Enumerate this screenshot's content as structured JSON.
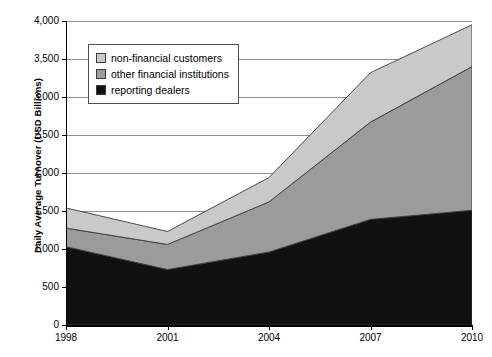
{
  "chart_data": {
    "type": "area",
    "stacked": true,
    "title": "",
    "xlabel": "",
    "ylabel": "Daily Average Turnover (USD Billions)",
    "categories": [
      "1998",
      "2001",
      "2004",
      "2007",
      "2010"
    ],
    "x": [
      1998,
      2001,
      2004,
      2007,
      2010
    ],
    "xlim": [
      1998,
      2010
    ],
    "ylim": [
      0,
      4000
    ],
    "y_ticks": [
      "0",
      "500",
      "1,000",
      "1,500",
      "2,000",
      "2,500",
      "3,000",
      "3,500",
      "4,000"
    ],
    "y_tick_values": [
      0,
      500,
      1000,
      1500,
      2000,
      2500,
      3000,
      3500,
      4000
    ],
    "y_tick_step": 500,
    "grid": true,
    "grid_axis": "y",
    "legend_position": "upper-left-inside",
    "series": [
      {
        "name": "reporting dealers",
        "color": "#111111",
        "values": [
          1030,
          730,
          960,
          1390,
          1510
        ]
      },
      {
        "name": "other financial institutions",
        "color": "#9b9b9b",
        "values": [
          245,
          330,
          660,
          1280,
          1890
        ]
      },
      {
        "name": "non-financial customers",
        "color": "#c9c9c9",
        "values": [
          265,
          170,
          320,
          650,
          550
        ]
      }
    ],
    "cumulative_totals": {
      "reporting_dealers": [
        1030,
        730,
        960,
        1390,
        1510
      ],
      "plus_other_financial": [
        1275,
        1060,
        1620,
        2670,
        3400
      ],
      "total": [
        1540,
        1230,
        1940,
        3320,
        3950
      ]
    },
    "colors": {
      "non_financial_customers": "#c9c9c9",
      "other_financial_institutions": "#9b9b9b",
      "reporting_dealers": "#111111",
      "gridline": "#8f8f8f",
      "axis": "#000000",
      "outline": "#3a3a3a",
      "background": "#ffffff"
    }
  },
  "legend": {
    "items": [
      {
        "label": "non-financial customers",
        "swatch": "#c9c9c9"
      },
      {
        "label": "other financial institutions",
        "swatch": "#9b9b9b"
      },
      {
        "label": "reporting dealers",
        "swatch": "#111111"
      }
    ]
  },
  "axes": {
    "y_title": "Daily Average Turnover (USD Billions)",
    "y_labels": [
      "4,000",
      "3,500",
      "3,000",
      "2,500",
      "2,000",
      "1,500",
      "1,000",
      "500",
      "0"
    ],
    "x_labels": [
      "1998",
      "2001",
      "2004",
      "2007",
      "2010"
    ]
  }
}
